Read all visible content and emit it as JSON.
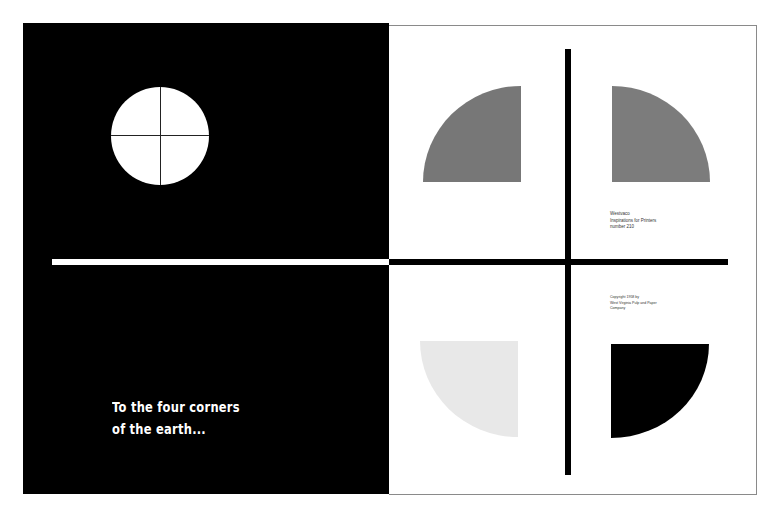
{
  "spread": {
    "left_page": {
      "background": "#000000",
      "tagline": {
        "line1": "To the four corners",
        "line2": "of the earth..."
      },
      "globe_icon": "circle-with-crosshair"
    },
    "right_page": {
      "background": "#ffffff",
      "quarter_discs": [
        {
          "position": "top-left",
          "color": "#777777"
        },
        {
          "position": "top-right",
          "color": "#7c7c7c"
        },
        {
          "position": "bottom-left",
          "color": "#e8e8e8"
        },
        {
          "position": "bottom-right",
          "color": "#000000"
        }
      ],
      "colophon_top": {
        "line1": "Westvaco",
        "line2": "Inspirations for Printers",
        "line3": "number 210"
      },
      "colophon_bottom": {
        "line1": "Copyright 1958 by",
        "line2": "West Virginia Pulp and Paper",
        "line3": "Company"
      }
    }
  }
}
